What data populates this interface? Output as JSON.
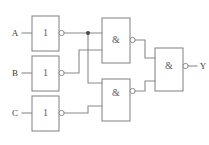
{
  "diagram": {
    "line_color": "#8a8a8a",
    "text_color": "#3a3a3a",
    "background": "#ffffff"
  },
  "inputs": [
    {
      "id": "A",
      "label": "A"
    },
    {
      "id": "B",
      "label": "B"
    },
    {
      "id": "C",
      "label": "C"
    }
  ],
  "outputs": [
    {
      "id": "Y",
      "label": "Y"
    }
  ],
  "gates": [
    {
      "id": "inv-a",
      "symbol": "1",
      "type": "NOT",
      "inverted_output": true
    },
    {
      "id": "inv-b",
      "symbol": "1",
      "type": "NOT",
      "inverted_output": true
    },
    {
      "id": "inv-c",
      "symbol": "1",
      "type": "NOT",
      "inverted_output": true
    },
    {
      "id": "nand-1",
      "symbol": "&",
      "type": "NAND",
      "inverted_output": true
    },
    {
      "id": "nand-2",
      "symbol": "&",
      "type": "NAND",
      "inverted_output": true
    },
    {
      "id": "nand-3",
      "symbol": "&",
      "type": "NAND",
      "inverted_output": true
    }
  ]
}
